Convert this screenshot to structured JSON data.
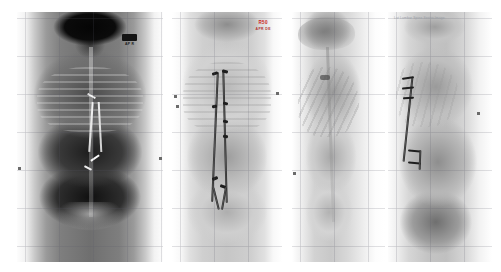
{
  "viewer": {
    "title": "Radiograph Comparison Viewer",
    "layout": "four-panel",
    "background_color": "#ffffff",
    "panel_count": 4
  },
  "panels": [
    {
      "id": "panel-1",
      "name": "AP full-spine radiograph (high contrast)",
      "view": "AP",
      "region": "full spine",
      "marker": {
        "glyph": "orientation-marker",
        "text": "AP  R"
      },
      "hardware": "spinal instrumentation",
      "grid": true
    },
    {
      "id": "panel-2",
      "name": "AP full-spine radiograph with instrumentation",
      "view": "AP",
      "region": "full spine",
      "marker": {
        "label": "R50",
        "sublabel": "APR DE"
      },
      "hardware": "dual posterior rods with pedicle screws",
      "grid": true
    },
    {
      "id": "panel-3",
      "name": "Lateral skull and thorax radiograph",
      "view": "Lateral",
      "region": "skull / thorax",
      "hardware": "none visible",
      "grid": true
    },
    {
      "id": "panel-4",
      "name": "Lateral lumbar radiograph with instrumentation",
      "view": "Lateral",
      "region": "thoracolumbar spine",
      "header_text": "Lat  Lumbar Spine  Series  Image",
      "hardware": "posterior rod with pedicle screws",
      "grid": true
    }
  ],
  "colors": {
    "background": "#ffffff",
    "marker_red": "#cc2222",
    "grid_line": "#5a5a69",
    "marker_dark": "#141414"
  }
}
